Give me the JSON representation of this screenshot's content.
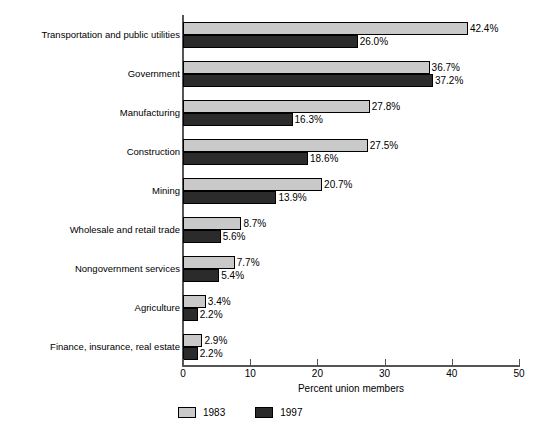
{
  "chart_data": {
    "type": "bar",
    "orientation": "horizontal",
    "title": "",
    "xlabel": "Percent union members",
    "ylabel": "",
    "xlim": [
      0,
      50
    ],
    "xticks": [
      "0",
      "10",
      "20",
      "30",
      "40",
      "50"
    ],
    "grid": false,
    "legend_position": "bottom-left",
    "categories": [
      "Transportation and public utilities",
      "Government",
      "Manufacturing",
      "Construction",
      "Mining",
      "Wholesale and retail trade",
      "Nongovernment services",
      "Agriculture",
      "Finance, insurance, real estate"
    ],
    "series": [
      {
        "name": "1983",
        "color": "#c9c9c9",
        "values": [
          42.4,
          36.7,
          27.8,
          27.5,
          20.7,
          8.7,
          7.7,
          3.4,
          2.9
        ],
        "labels": [
          "42.4%",
          "36.7%",
          "27.8%",
          "27.5%",
          "20.7%",
          "8.7%",
          "7.7%",
          "3.4%",
          "2.9%"
        ]
      },
      {
        "name": "1997",
        "color": "#2b2b2b",
        "values": [
          26.0,
          37.2,
          16.3,
          18.6,
          13.9,
          5.6,
          5.4,
          2.2,
          2.2
        ],
        "labels": [
          "26.0%",
          "37.2%",
          "16.3%",
          "18.6%",
          "13.9%",
          "5.6%",
          "5.4%",
          "2.2%",
          "2.2%"
        ]
      }
    ]
  },
  "legend": {
    "items": [
      {
        "label": "1983",
        "color": "#c9c9c9"
      },
      {
        "label": "1997",
        "color": "#2b2b2b"
      }
    ]
  },
  "axis": {
    "x_title": "Percent union members"
  }
}
